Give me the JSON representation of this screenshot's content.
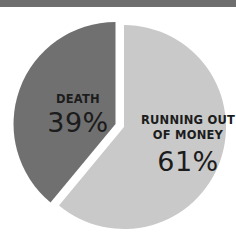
{
  "chart_data": {
    "type": "pie",
    "title": "",
    "categories": [
      "Death",
      "Running out of money"
    ],
    "values": [
      39,
      61
    ],
    "unit": "%",
    "exploded": [
      "Death"
    ],
    "legend": "none (labels inside slices)",
    "series": [
      {
        "name": "Death",
        "label": "DEATH",
        "value": 39,
        "display": "39%",
        "color": "#707070"
      },
      {
        "name": "Running out of money",
        "label_line1": "RUNNING OUT",
        "label_line2": "OF MONEY",
        "value": 61,
        "display": "61%",
        "color": "#c9c9c9"
      }
    ]
  },
  "colors": {
    "background": "#ffffff",
    "top_band": "#6e6e6e",
    "text": "#1c1c1c"
  },
  "slices": {
    "death": {
      "label": "DEATH",
      "percent": "39%"
    },
    "money": {
      "label_line1": "RUNNING OUT",
      "label_line2": "OF MONEY",
      "percent": "61%"
    }
  }
}
